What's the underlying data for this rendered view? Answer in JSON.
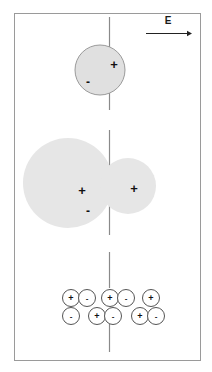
{
  "figure": {
    "title": "",
    "frame": {
      "border_color": "#9a9a9a",
      "background": "#ffffff",
      "x": 14,
      "y": 13,
      "width": 186,
      "height": 347
    },
    "field_arrow": {
      "label": "E",
      "name": "electric-field-arrow",
      "direction": "right",
      "color": "#222222",
      "x1": 146,
      "x2": 192,
      "y": 33,
      "label_x": 168,
      "label_y": 24
    },
    "axis_line": {
      "name": "vertical-dashed-axis",
      "color": "#8a8a8a",
      "x": 109,
      "segments": [
        {
          "y1": 17,
          "y2": 110
        },
        {
          "y1": 130,
          "y2": 235
        },
        {
          "y1": 252,
          "y2": 288
        },
        {
          "y1": 322,
          "y2": 352
        }
      ]
    },
    "shapes": {
      "fill": "#e6e6e6",
      "outline": "#9a9a9a",
      "top_sphere": {
        "name": "top-charged-sphere",
        "cx": 100,
        "cy": 70,
        "r": 25,
        "charges": [
          {
            "sign": "+",
            "x": 114,
            "y": 64,
            "size": "big"
          },
          {
            "sign": "-",
            "x": 88,
            "y": 82,
            "size": "big"
          }
        ]
      },
      "merged_blob": {
        "name": "merged-charged-blob",
        "left_circle": {
          "cx": 68,
          "cy": 183,
          "r": 45
        },
        "right_circle": {
          "cx": 128,
          "cy": 186,
          "r": 28
        },
        "charges": [
          {
            "sign": "+",
            "x": 82,
            "y": 190,
            "size": "big"
          },
          {
            "sign": "+",
            "x": 134,
            "y": 188,
            "size": "big"
          },
          {
            "sign": "-",
            "x": 88,
            "y": 211,
            "size": "big"
          }
        ]
      }
    },
    "charge_rows": {
      "name": "ion-pair-lattice",
      "circle_r": 8.5,
      "outline": "#555555",
      "fill": "#ffffff",
      "rows": [
        {
          "name": "ion-row-top",
          "y": 298,
          "items": [
            {
              "sign": "+",
              "cx": 71
            },
            {
              "sign": "-",
              "cx": 87
            },
            {
              "sign": "+",
              "cx": 110
            },
            {
              "sign": "-",
              "cx": 126
            },
            {
              "sign": "+",
              "cx": 151
            }
          ]
        },
        {
          "name": "ion-row-bottom",
          "y": 316,
          "items": [
            {
              "sign": "-",
              "cx": 71
            },
            {
              "sign": "+",
              "cx": 97
            },
            {
              "sign": "-",
              "cx": 113
            },
            {
              "sign": "+",
              "cx": 140
            },
            {
              "sign": "-",
              "cx": 156
            }
          ]
        }
      ]
    }
  }
}
